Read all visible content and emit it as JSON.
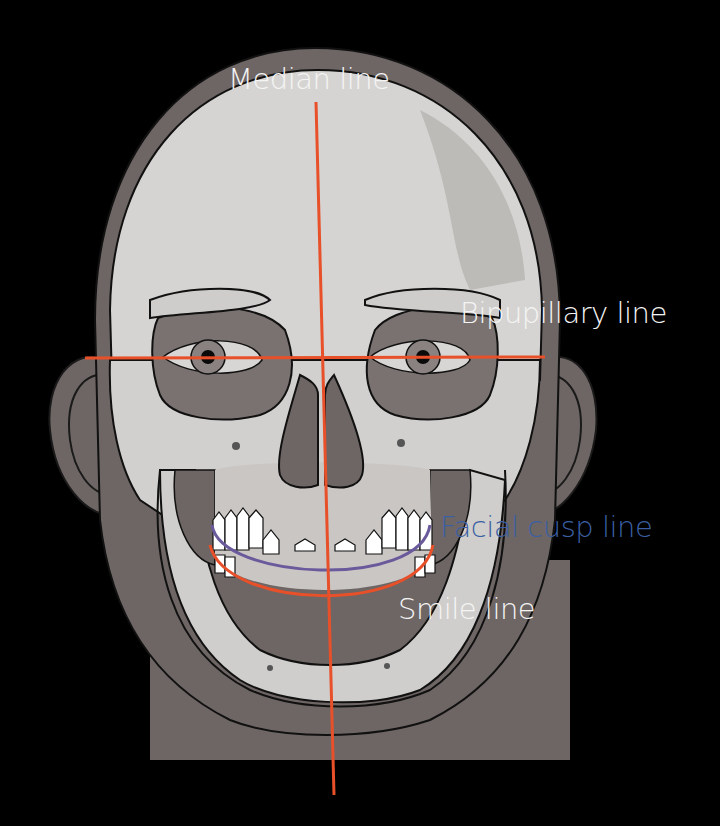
{
  "diagram": {
    "background_color": "#000000",
    "colors": {
      "reference_line_orange": "#e8502a",
      "facial_cusp_line_purple": "#6a5a9c",
      "facial_cusp_label_blue": "#3b5fa3",
      "label_white": "#f4f4f4",
      "skin_gray": "#6e6664",
      "bone_light": "#d6d4d2",
      "bone_shadow": "#a9a6a4"
    },
    "labels": {
      "median_line": "Median line",
      "bipupillary_line": "Bipupillary line",
      "facial_cusp_line": "Facial cusp line",
      "smile_line": "Smile line"
    }
  }
}
